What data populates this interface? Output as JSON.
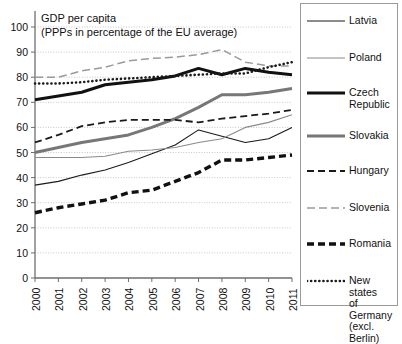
{
  "chart_data": {
    "type": "line",
    "title": "GDP per capita\n(PPPs in percentage of the EU average)",
    "xlabel": "",
    "ylabel": "",
    "ylim": [
      0,
      100
    ],
    "ytick_values": [
      0,
      10,
      20,
      30,
      40,
      50,
      60,
      70,
      80,
      90,
      100
    ],
    "grid": true,
    "legend_position": "right",
    "x": [
      "2000",
      "2001",
      "2002",
      "2003",
      "2004",
      "2005",
      "2006",
      "2007",
      "2008",
      "2009",
      "2010",
      "2011"
    ],
    "series": [
      {
        "name": "Latvia",
        "style": "solid-thin-black",
        "color": "#1a1a1a",
        "values": [
          37,
          38.5,
          41,
          43,
          46,
          49.5,
          53,
          59,
          56.5,
          54,
          55.5,
          60
        ]
      },
      {
        "name": "Poland",
        "style": "solid-thin-gray",
        "color": "#8a8a8a",
        "values": [
          48,
          48,
          48,
          48.5,
          50.5,
          51,
          52,
          54,
          55.5,
          60,
          62,
          65
        ]
      },
      {
        "name": "Czech Republic",
        "style": "solid-thick-black",
        "color": "#111111",
        "values": [
          71,
          72.5,
          74,
          77,
          78,
          79,
          80.5,
          83.5,
          81,
          83.5,
          82,
          81
        ]
      },
      {
        "name": "Slovakia",
        "style": "solid-thick-gray",
        "color": "#777777",
        "values": [
          50,
          52,
          54,
          55.5,
          57,
          60,
          63.5,
          68,
          73,
          73,
          74,
          75.5
        ]
      },
      {
        "name": "Hungary",
        "style": "dashed-black",
        "color": "#1a1a1a",
        "values": [
          54,
          57,
          60.5,
          62,
          63,
          63,
          63,
          62,
          63.5,
          64.5,
          65.5,
          67
        ]
      },
      {
        "name": "Slovenia",
        "style": "dashed-gray",
        "color": "#9a9a9a",
        "values": [
          80,
          80,
          82.5,
          84,
          86.5,
          87.5,
          88,
          89,
          91,
          86,
          84.5,
          84.5
        ]
      },
      {
        "name": "Romania",
        "style": "dashed-thick-black",
        "color": "#111111",
        "values": [
          26,
          28,
          29.5,
          31,
          34,
          35,
          38.5,
          42,
          47,
          47,
          48,
          49
        ]
      },
      {
        "name": "New states of Germany (excl. Berlin)",
        "style": "dotted-black",
        "color": "#1a1a1a",
        "values": [
          77.5,
          77.5,
          78,
          79,
          79.5,
          80,
          80.5,
          81,
          81.5,
          81.5,
          84,
          86
        ]
      }
    ]
  },
  "legend": {
    "items": [
      {
        "label": "Latvia"
      },
      {
        "label": "Poland"
      },
      {
        "label": "Czech\nRepublic"
      },
      {
        "label": "Slovakia"
      },
      {
        "label": "Hungary"
      },
      {
        "label": "Slovenia"
      },
      {
        "label": "Romania"
      },
      {
        "label": "New states\nof Germany\n(excl. Berlin)"
      }
    ]
  },
  "colors": {
    "axis": "#6e6e6e",
    "grid": "#b9b9b9",
    "text": "#111111",
    "legend_border": "#9a9a9a",
    "background": "#ffffff"
  }
}
